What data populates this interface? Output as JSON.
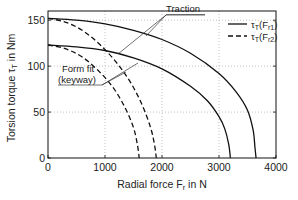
{
  "chart_data": {
    "type": "line",
    "title": "",
    "xlabel": "Radial force F_r in N",
    "ylabel": "Torsion torque τ_T in Nm",
    "xlabel_parts": {
      "main": "Radial force F",
      "sub": "r",
      "tail": " in N"
    },
    "ylabel_parts": {
      "main": "Torsion torque τ",
      "sub": "T",
      "tail": " in Nm"
    },
    "xlim": [
      0,
      4000
    ],
    "ylim": [
      0,
      160
    ],
    "xticks": [
      0,
      1000,
      2000,
      3000,
      4000
    ],
    "yticks": [
      0,
      50,
      100,
      150
    ],
    "grid": true,
    "legend_position": "upper right",
    "legend": [
      {
        "label": "τT(Fr1)",
        "main": "τ",
        "sub1": "T",
        "mid": "(F",
        "sub2": "r1",
        "end": ")",
        "style": "solid"
      },
      {
        "label": "τT(Fr2)",
        "main": "τ",
        "sub1": "T",
        "mid": "(F",
        "sub2": "r2",
        "end": ")",
        "style": "dashed"
      }
    ],
    "annotations": [
      {
        "text": "Traction",
        "points_to": [
          "Traction τT(Fr1)",
          "Traction τT(Fr2)"
        ]
      },
      {
        "text": "Form fit",
        "text2": "(keyway)",
        "points_to": [
          "Form fit τT(Fr1)",
          "Form fit τT(Fr2)"
        ]
      }
    ],
    "series": [
      {
        "name": "Traction τT(Fr1)",
        "style": "solid",
        "x": [
          0,
          500,
          1000,
          1500,
          2000,
          2500,
          3000,
          3300,
          3500,
          3600,
          3630,
          3650
        ],
        "y": [
          152,
          150,
          146,
          139,
          129,
          114,
          92,
          72,
          52,
          30,
          12,
          0
        ]
      },
      {
        "name": "Form fit τT(Fr1)",
        "style": "solid",
        "x": [
          0,
          500,
          1000,
          1500,
          2000,
          2500,
          2800,
          3000,
          3100,
          3170,
          3200
        ],
        "y": [
          123,
          121,
          117,
          109,
          97,
          78,
          62,
          45,
          32,
          15,
          0
        ]
      },
      {
        "name": "Traction τT(Fr2)",
        "style": "dashed",
        "x": [
          0,
          300,
          600,
          900,
          1200,
          1450,
          1650,
          1800,
          1870,
          1900
        ],
        "y": [
          152,
          148,
          139,
          124,
          104,
          82,
          58,
          33,
          14,
          0
        ]
      },
      {
        "name": "Form fit τT(Fr2)",
        "style": "dashed",
        "x": [
          0,
          300,
          600,
          900,
          1150,
          1350,
          1500,
          1570,
          1600
        ],
        "y": [
          123,
          119,
          110,
          94,
          76,
          55,
          33,
          14,
          0
        ]
      }
    ]
  }
}
